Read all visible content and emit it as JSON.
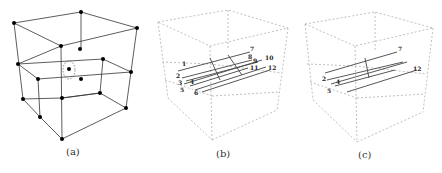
{
  "figure": {
    "panels": [
      {
        "id": "a",
        "caption": "(a)",
        "description": "Cube lattice with nodes, one central node circled by dashed ellipse"
      },
      {
        "id": "b",
        "caption": "(b)",
        "description": "Dashed cube with 12 labeled arrows in middle layer",
        "labels_left": [
          "1",
          "2",
          "3",
          "4",
          "5",
          "6"
        ],
        "labels_right": [
          "7",
          "8",
          "9",
          "10",
          "11",
          "12"
        ]
      },
      {
        "id": "c",
        "caption": "(c)",
        "description": "Dashed cube with subset of arrows",
        "labels_left": [
          "2",
          "4",
          "5"
        ],
        "labels_right": [
          "7",
          "12"
        ]
      }
    ]
  },
  "colors": {
    "line": "#333333",
    "dashed": "#b0b0b0",
    "node": "#000000",
    "arrow": "#444444"
  }
}
